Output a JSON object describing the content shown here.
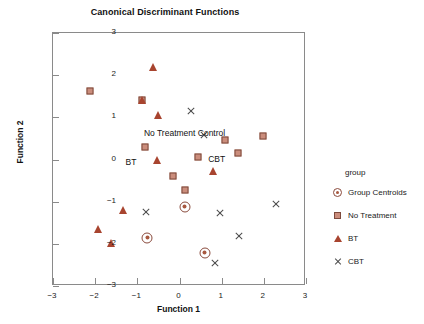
{
  "chart_data": {
    "type": "scatter",
    "title": "Canonical Discriminant Functions",
    "xlabel": "Function 1",
    "ylabel": "Function 2",
    "xlim": [
      -3,
      3
    ],
    "ylim": [
      -3,
      3
    ],
    "xticks": [
      "-3",
      "-2",
      "-1",
      "0",
      "1",
      "2",
      "3"
    ],
    "yticks": [
      "3",
      "2",
      "1",
      "0",
      "-1",
      "-2",
      "-3"
    ],
    "grid": false,
    "legend_position": "right",
    "legend_title": "group",
    "series": [
      {
        "name": "No Treatment",
        "marker": "square",
        "color": "#cb8d7c",
        "points": [
          [
            -2.13,
            1.63
          ],
          [
            -0.88,
            1.4
          ],
          [
            -0.82,
            0.29
          ],
          [
            -0.15,
            -0.39
          ],
          [
            0.12,
            -0.73
          ],
          [
            0.44,
            0.05
          ],
          [
            1.07,
            0.47
          ],
          [
            1.39,
            0.15
          ],
          [
            1.97,
            0.56
          ]
        ]
      },
      {
        "name": "BT",
        "marker": "triangle",
        "color": "#a8442f",
        "points": [
          [
            -0.62,
            2.19
          ],
          [
            -0.88,
            1.4
          ],
          [
            -0.5,
            1.06
          ],
          [
            -0.53,
            -0.01
          ],
          [
            -1.34,
            -1.2
          ],
          [
            -1.94,
            -1.66
          ],
          [
            -1.63,
            -1.99
          ],
          [
            0.8,
            -0.28
          ]
        ]
      },
      {
        "name": "CBT",
        "marker": "cross",
        "color": "#4a4a4a",
        "points": [
          [
            0.27,
            1.14
          ],
          [
            0.58,
            0.79
          ],
          [
            -0.8,
            -0.81
          ],
          [
            0.95,
            -0.63
          ],
          [
            1.4,
            -0.97
          ],
          [
            0.85,
            -1.39
          ],
          [
            2.29,
            0.23
          ]
        ]
      },
      {
        "name": "Group Centroids",
        "marker": "centroid",
        "color": "#a8583f",
        "points": [
          [
            0.12,
            0.37
          ],
          [
            -0.76,
            -0.1
          ],
          [
            0.6,
            -0.19
          ]
        ]
      }
    ],
    "annotations": [
      {
        "text": "No Treatment Control",
        "x": 0.12,
        "y": 0.63,
        "anchor": "center"
      },
      {
        "text": "BT",
        "x": -1.02,
        "y": -0.06,
        "anchor": "end"
      },
      {
        "text": "CBT",
        "x": 0.68,
        "y": 0.02,
        "anchor": "start"
      }
    ],
    "legend_entries": [
      {
        "label": "Group Centroids",
        "marker": "centroid"
      },
      {
        "label": "No Treatment",
        "marker": "square"
      },
      {
        "label": "BT",
        "marker": "triangle"
      },
      {
        "label": "CBT",
        "marker": "cross"
      }
    ]
  }
}
